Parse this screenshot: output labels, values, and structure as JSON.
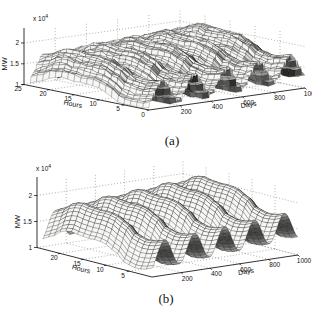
{
  "figure": {
    "background": "#ffffff",
    "kind": "two stacked MATLAB-style 3-D mesh surface plots of electric load"
  },
  "chart_data": [
    {
      "id": "a",
      "caption": "(a)",
      "type": "3d-surface-mesh",
      "title": "",
      "xlabel": "Days",
      "ylabel": "Hours",
      "zlabel": "MW",
      "z_scale_prefix": "x 10",
      "z_scale_exponent": "4",
      "x_range": [
        0,
        1000
      ],
      "x_ticks": [
        200,
        400,
        600,
        800,
        1000
      ],
      "y_range": [
        0,
        25
      ],
      "y_ticks": [
        25,
        20,
        15,
        10,
        5,
        0
      ],
      "z_range": [
        1,
        2.25
      ],
      "z_ticks": [
        2,
        1.5,
        1
      ],
      "grid": "dotted",
      "legend": "none",
      "description": "Raw hourly electric load surface (MW, x10^4) over about 1000 days and 24 hours; noisy mesh with weekly ripples riding on about five seasonal waves, values rising from about 1.2e4 to peaks near 2.1e4 MW.",
      "surface_model": {
        "base": 1.58,
        "growth_per_day": 0.0002,
        "seasonal_amplitude": 0.26,
        "seasonal_period_days": 205,
        "seasonal_phase_days": 35,
        "hour_profile": [
          [
            0,
            -0.18
          ],
          [
            2,
            -0.25
          ],
          [
            4,
            -0.26
          ],
          [
            6,
            -0.2
          ],
          [
            8,
            -0.05
          ],
          [
            10,
            0.05
          ],
          [
            12,
            0.09
          ],
          [
            14,
            0.08
          ],
          [
            16,
            0.1
          ],
          [
            18,
            0.13
          ],
          [
            20,
            0.06
          ],
          [
            22,
            -0.08
          ],
          [
            24,
            -0.16
          ]
        ],
        "weekly_ripple_depth": 0.12,
        "weekly_period_days": 7,
        "noise_amplitude": 0.03,
        "noise_seed": 11,
        "grid_step_days": 5,
        "grid_step_hours": 1.25
      }
    },
    {
      "id": "b",
      "caption": "(b)",
      "type": "3d-surface-mesh",
      "title": "",
      "xlabel": "Days",
      "ylabel": "Hours",
      "zlabel": "MW",
      "z_scale_prefix": "x 10",
      "z_scale_exponent": "4",
      "x_range": [
        0,
        1000
      ],
      "x_ticks": [
        200,
        400,
        600,
        800,
        1000
      ],
      "y_range": [
        0,
        25
      ],
      "y_ticks": [
        20,
        15,
        10,
        5
      ],
      "z_range": [
        1,
        2.25
      ],
      "z_ticks": [
        2,
        1.5,
        1
      ],
      "grid": "dotted",
      "legend": "none",
      "description": "Smoothed version of the same load surface: about five smooth seasonal wave crests (peaks near 2e4 MW, valleys near 1.1e4) with the daily hour profile preserved.",
      "surface_model": {
        "base": 1.58,
        "growth_per_day": 0.0002,
        "seasonal_amplitude": 0.26,
        "seasonal_period_days": 205,
        "seasonal_phase_days": 35,
        "hour_profile": [
          [
            0,
            -0.18
          ],
          [
            2,
            -0.25
          ],
          [
            4,
            -0.26
          ],
          [
            6,
            -0.2
          ],
          [
            8,
            -0.05
          ],
          [
            10,
            0.05
          ],
          [
            12,
            0.09
          ],
          [
            14,
            0.08
          ],
          [
            16,
            0.1
          ],
          [
            18,
            0.13
          ],
          [
            20,
            0.06
          ],
          [
            22,
            -0.08
          ],
          [
            24,
            -0.16
          ]
        ],
        "weekly_ripple_depth": 0,
        "weekly_period_days": 7,
        "noise_amplitude": 0,
        "noise_seed": 11,
        "grid_step_days": 10,
        "grid_step_hours": 1.25
      }
    }
  ]
}
